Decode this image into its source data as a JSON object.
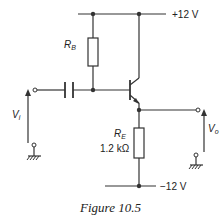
{
  "figure": {
    "caption": "Figure 10.5",
    "supply_positive": "+12 V",
    "supply_negative": "−12 V",
    "rb_label": "R",
    "rb_sub": "B",
    "re_label": "R",
    "re_sub": "E",
    "re_value": "1.2 kΩ",
    "vin_label": "V",
    "vin_sub": "i",
    "vout_label": "V",
    "vout_sub": "o",
    "colors": {
      "line": "#333333",
      "background": "#ffffff"
    }
  }
}
